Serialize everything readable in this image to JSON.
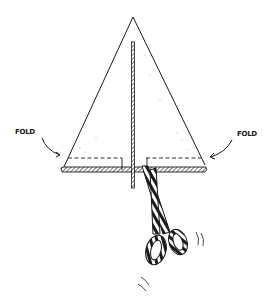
{
  "illustration": {
    "subject": "folded paper triangle with cut line and scissors",
    "labels": {
      "fold_left": "FOLD",
      "fold_right": "FOLD"
    },
    "colors": {
      "ink": "#1a1a1a",
      "background": "#ffffff"
    }
  }
}
